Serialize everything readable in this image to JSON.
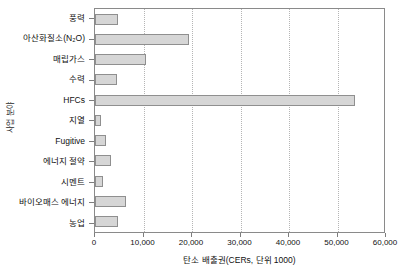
{
  "chart_data": {
    "type": "bar",
    "orientation": "horizontal",
    "title": "",
    "xlabel": "탄소 배출권(CERs, 단위 1000)",
    "ylabel": "사업 분야",
    "xlim": [
      0,
      60000
    ],
    "xticks": [
      0,
      10000,
      20000,
      30000,
      40000,
      50000,
      60000
    ],
    "xtick_labels": [
      "0",
      "10,000",
      "20,000",
      "30,000",
      "40,000",
      "50,000",
      "60,000"
    ],
    "grid": "vertical-dotted",
    "legend": "none",
    "bar_fill": "#d6d6d6",
    "bar_border": "#8f8f8f",
    "categories": [
      "풍력",
      "아산화질소(N₂O)",
      "매립가스",
      "수력",
      "HFCs",
      "지열",
      "Fugitive",
      "에너지 절약",
      "시멘트",
      "바이오매스 에너지",
      "농업"
    ],
    "values": [
      4700,
      19400,
      10500,
      4500,
      53600,
      1300,
      2300,
      3300,
      1700,
      6400,
      4700
    ],
    "points": [
      {
        "label": "풍력",
        "value": 4700
      },
      {
        "label": "아산화질소(N₂O)",
        "value": 19400
      },
      {
        "label": "매립가스",
        "value": 10500
      },
      {
        "label": "수력",
        "value": 4500
      },
      {
        "label": "HFCs",
        "value": 53600
      },
      {
        "label": "지열",
        "value": 1300
      },
      {
        "label": "Fugitive",
        "value": 2300
      },
      {
        "label": "에너지 절약",
        "value": 3300
      },
      {
        "label": "시멘트",
        "value": 1700
      },
      {
        "label": "바이오매스 에너지",
        "value": 6400
      },
      {
        "label": "농업",
        "value": 4700
      }
    ]
  }
}
